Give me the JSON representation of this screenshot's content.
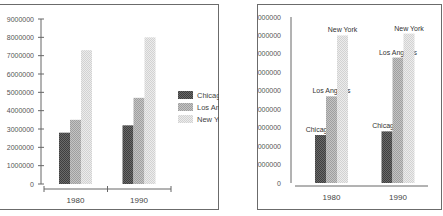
{
  "chart_data": [
    {
      "type": "bar",
      "title": "",
      "xlabel": "",
      "ylabel": "",
      "categories": [
        "1980",
        "1990"
      ],
      "series": [
        {
          "name": "Chicago",
          "values": [
            2800000,
            3200000
          ]
        },
        {
          "name": "Los Angeles",
          "values": [
            3500000,
            4700000
          ]
        },
        {
          "name": "New York",
          "values": [
            7300000,
            8000000
          ]
        }
      ],
      "ylim": [
        0,
        9000000
      ],
      "yticks": [
        "0",
        "1000000",
        "2000000",
        "3000000",
        "4000000",
        "5000000",
        "6000000",
        "7000000",
        "8000000",
        "9000000"
      ],
      "legend": "right",
      "grid": false,
      "series_colors": [
        "#4a4a4a",
        "#a9a9a9",
        "#d9d9d9"
      ]
    },
    {
      "type": "bar",
      "title": "",
      "xlabel": "",
      "ylabel": "",
      "categories": [
        "1980",
        "1990"
      ],
      "series": [
        {
          "name": "Chicago",
          "values": [
            2600000,
            2800000
          ]
        },
        {
          "name": "Los Angeles",
          "values": [
            4700000,
            6800000
          ]
        },
        {
          "name": "New York",
          "values": [
            8000000,
            8100000
          ]
        }
      ],
      "ylim": [
        0,
        9000000
      ],
      "yticks": [
        "0",
        "1000000",
        "2000000",
        "3000000",
        "4000000",
        "5000000",
        "6000000",
        "7000000",
        "8000000",
        "9000000"
      ],
      "legend": "none",
      "data_labels": "series-name-above-bar",
      "grid": false,
      "series_colors": [
        "#4a4a4a",
        "#a9a9a9",
        "#d9d9d9"
      ]
    }
  ]
}
